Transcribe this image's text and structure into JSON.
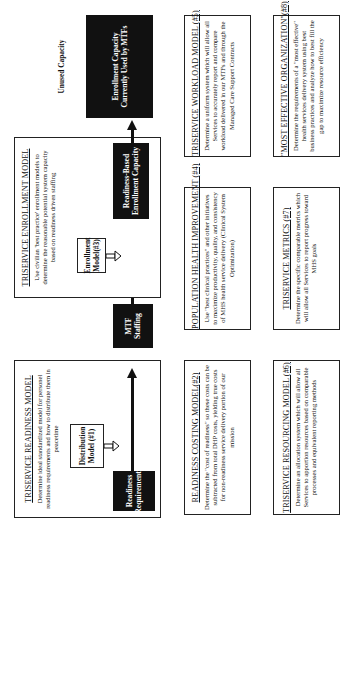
{
  "readiness_model": {
    "title": "TRISERVICE READINESS MODEL",
    "description": "Determine ideal standardized model for personel readiness requirements and how to distribute them in peacetime",
    "sub_box": "Distribution Model (#1)",
    "dark_box": "Readiness Requirements"
  },
  "mtf_staffing": "MTF Staffing",
  "enrollment_model": {
    "title": "TRISERVICE ENROLLMENT MODEL",
    "description": "Use civilian 'best practice' enrollment models to determine the reasonable potential system capacity based on readiness driven staffing",
    "sub_box": "Enrollment Model(#3)",
    "dark_box": "Readiness-Based Enrollment Capacity"
  },
  "capacity": {
    "unused": "Unused Capacity",
    "used": "Enrollment Capacity Currently Used by MTFs"
  },
  "row2": [
    {
      "title": "READINESS COSTING MODEL(#2)",
      "description": "Determine the \"cost of readiness\" so these costs can be subtracted from total DHP costs, yielding true costs for non-readiness service delivery portion of our mission"
    },
    {
      "title": "POPULATION HEALTH IMPROVEMENT (#4)",
      "description": "Use \"best clinical practices\" and other initiatives to maximize productivity, quality, and consistency of MHS health service delivery (Clinical System Optimization)"
    },
    {
      "title": "TRISERVICE WORKLOAD MODEL (#5)",
      "description": "Determine a uniform system which will allow all Services to accurately report and compare workload delivered in our MTFs and through the Managed Care Support Contracts"
    }
  ],
  "row3": [
    {
      "title": "TRISERVICE RESOURCING MODEL (#6)",
      "description": "Determine an allocation system which will allow all Services to apportion resources based on comparable processes and equivalent reporting methods"
    },
    {
      "title": "TRISERVICE METRICS (#7)",
      "description": "Determine the specific comparable metrics which will allow all Services to report progress toward MHS goals"
    },
    {
      "title": "\"MOST EFFECTIVE ORGANIZATION\"(#8)",
      "description": "Determine the requirements of a \"most effective\" health services delivery system using best business practices and analyze how to best fill the gap to maximize resource efficiency"
    }
  ],
  "colors": {
    "dark_fill": "#111111",
    "line": "#222222",
    "background": "#ffffff"
  }
}
